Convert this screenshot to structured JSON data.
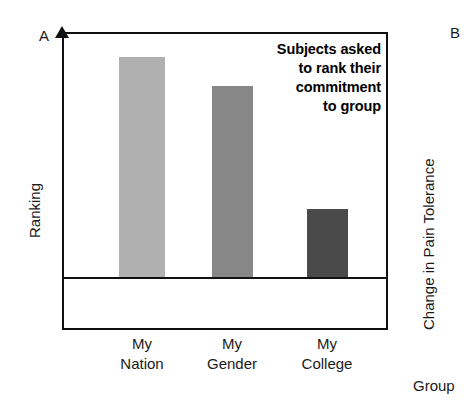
{
  "figure": {
    "panel_a_label": "A",
    "panel_b_label": "B"
  },
  "panel_a": {
    "y_axis_title": "Ranking",
    "annotation": {
      "line1": "Subjects asked",
      "line2": "to rank their",
      "line3": "commitment",
      "line4": "to group"
    }
  },
  "panel_b": {
    "y_axis_title": "Change in Pain Tolerance",
    "x_axis_title": "Group"
  },
  "colors": {
    "bar_my_nation": "#b0b0b0",
    "bar_my_gender": "#878787",
    "bar_my_college": "#4a4a4a",
    "axis": "#111111",
    "background": "#ffffff"
  },
  "chart_data": {
    "type": "bar",
    "title": "",
    "xlabel": "",
    "ylabel": "Ranking",
    "categories": [
      "My Nation",
      "My Gender",
      "My College"
    ],
    "category_lines": [
      [
        "My",
        "Nation"
      ],
      [
        "My",
        "Gender"
      ],
      [
        "My",
        "College"
      ]
    ],
    "values": [
      90,
      78,
      28
    ],
    "ylim": [
      0,
      100
    ],
    "grid": false,
    "legend": false,
    "annotations": [
      "Subjects asked to rank their commitment to group"
    ],
    "bar_colors": [
      "#b0b0b0",
      "#878787",
      "#4a4a4a"
    ]
  }
}
